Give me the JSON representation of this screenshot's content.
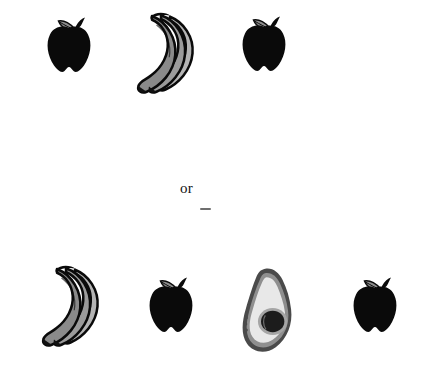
{
  "canvas": {
    "width": 428,
    "height": 378,
    "background": "#ffffff"
  },
  "connector": {
    "or_label": "or",
    "dash_mark": ""
  },
  "palette": {
    "apple_body": "#0a0a0a",
    "apple_leaf_fill": "#8c8c8c",
    "apple_leaf_outline": "#0a0a0a",
    "apple_stem": "#0a0a0a",
    "banana_fill": "#9b9b9b",
    "banana_fill_shadow": "#8a8a8a",
    "banana_fill_light": "#b4b4b4",
    "banana_outline": "#0a0a0a",
    "banana_tip": "#111111",
    "avocado_skin": "#4a4a4a",
    "avocado_rind": "#8f8f8f",
    "avocado_flesh": "#e8e8e8",
    "avocado_pit": "#1c1c1c",
    "avocado_pit_ring": "#a5a5a5",
    "text": "#111111",
    "dash": "#6e6e6e"
  },
  "options": [
    {
      "id": "option-top",
      "name": "top-choice",
      "items": [
        {
          "kind": "apple",
          "label": "apple",
          "x": 44,
          "y": 14,
          "w": 50,
          "h": 64
        },
        {
          "kind": "bananas",
          "label": "bananas",
          "x": 126,
          "y": 10,
          "w": 76,
          "h": 90
        },
        {
          "kind": "apple",
          "label": "apple",
          "x": 239,
          "y": 13,
          "w": 50,
          "h": 64
        }
      ]
    },
    {
      "id": "option-bottom",
      "name": "bottom-choice",
      "items": [
        {
          "kind": "bananas",
          "label": "bananas",
          "x": 31,
          "y": 263,
          "w": 76,
          "h": 90
        },
        {
          "kind": "apple",
          "label": "apple",
          "x": 146,
          "y": 274,
          "w": 50,
          "h": 64
        },
        {
          "kind": "avocado",
          "label": "avocado",
          "x": 238,
          "y": 265,
          "w": 62,
          "h": 92
        },
        {
          "kind": "apple",
          "label": "apple",
          "x": 350,
          "y": 274,
          "w": 50,
          "h": 64
        }
      ]
    }
  ],
  "counts": {
    "top_apples": 2,
    "top_bananas": 1,
    "bottom_apples": 2,
    "bottom_bananas": 1,
    "bottom_avocados": 1
  }
}
